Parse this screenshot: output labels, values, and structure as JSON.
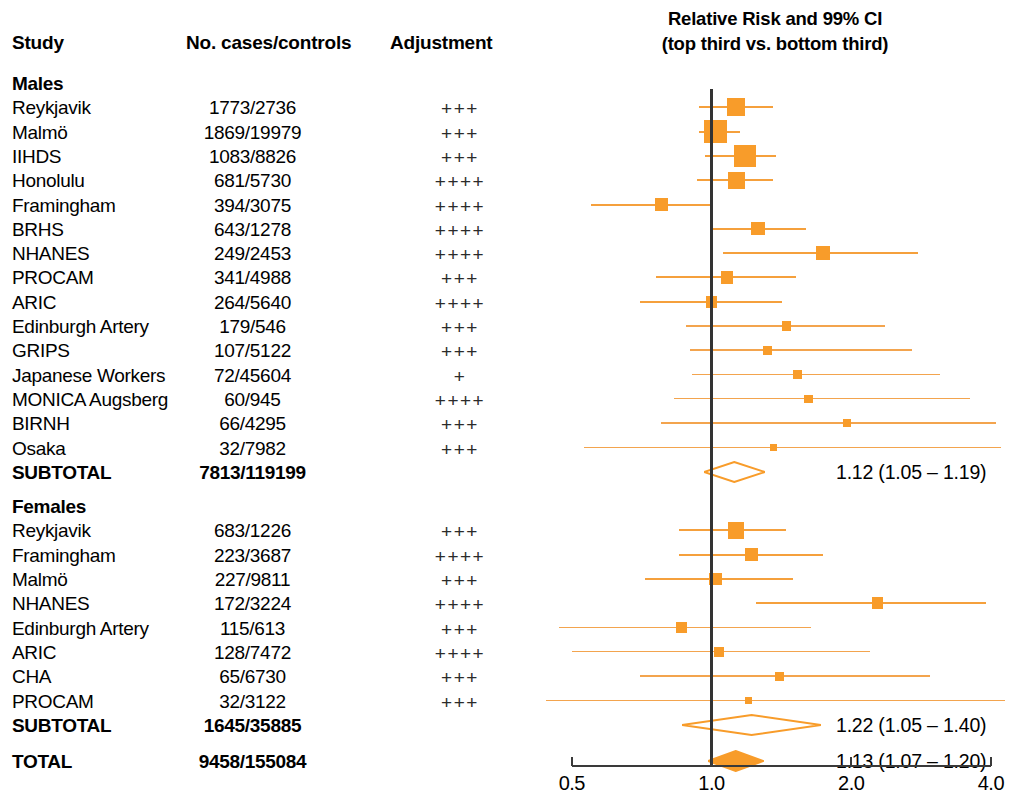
{
  "header": {
    "study": "Study",
    "cases": "No. cases/controls",
    "adjustment": "Adjustment",
    "plot_title_line1": "Relative Risk and 99% CI",
    "plot_title_line2": "(top third vs. bottom third)"
  },
  "axis": {
    "ticks": [
      "0.5",
      "1.0",
      "2.0",
      "4.0"
    ],
    "tick_values": [
      0.5,
      1.0,
      2.0,
      4.0
    ],
    "scale": "log",
    "reference_value": 1.0
  },
  "groups": [
    {
      "name": "Males"
    },
    {
      "name": "Females"
    }
  ],
  "summaries": {
    "males_subtotal_label": "SUBTOTAL",
    "males_subtotal_n": "7813/119199",
    "males_subtotal_text": "1.12 (1.05 – 1.19)",
    "females_subtotal_label": "SUBTOTAL",
    "females_subtotal_n": "1645/35885",
    "females_subtotal_text": "1.22 (1.05 – 1.40)",
    "total_label": "TOTAL",
    "total_n": "9458/155084",
    "total_text": "1.13 (1.07 – 1.20)"
  },
  "colors": {
    "marker": "#f89c2a",
    "ci": "#f5a03c",
    "reference_line": "#333333",
    "axis": "#3a3a3a",
    "text": "#000000"
  },
  "chart_data": {
    "type": "scatter",
    "title": "Relative Risk and 99% CI (top third vs. bottom third)",
    "xlabel": "Relative Risk",
    "ylabel": "",
    "xscale": "log",
    "xlim": [
      0.5,
      4.0
    ],
    "xticks": [
      0.5,
      1.0,
      2.0,
      4.0
    ],
    "xticklabels": [
      "0.5",
      "1.0",
      "2.0",
      "4.0"
    ],
    "reference_line": 1.0,
    "grid": false,
    "legend": "none",
    "columns": [
      "Study",
      "No. cases/controls",
      "Adjustment",
      "RR",
      "CI low",
      "CI high"
    ],
    "groups": [
      {
        "name": "Males",
        "rows": [
          {
            "study": "Reykjavik",
            "n": "1773/2736",
            "adjustment": "+++",
            "rr": 1.13,
            "lo": 0.94,
            "hi": 1.36,
            "weight": 9.0,
            "marker": "square"
          },
          {
            "study": "Malmö",
            "n": "1869/19979",
            "adjustment": "+++",
            "rr": 1.02,
            "lo": 0.94,
            "hi": 1.15,
            "weight": 12.5,
            "marker": "square"
          },
          {
            "study": "IIHDS",
            "n": "1083/8826",
            "adjustment": "+++",
            "rr": 1.18,
            "lo": 0.97,
            "hi": 1.38,
            "weight": 11.5,
            "marker": "square"
          },
          {
            "study": "Honolulu",
            "n": "681/5730",
            "adjustment": "++++",
            "rr": 1.13,
            "lo": 0.93,
            "hi": 1.36,
            "weight": 8.5,
            "marker": "square"
          },
          {
            "study": "Framingham",
            "n": "394/3075",
            "adjustment": "++++",
            "rr": 0.78,
            "lo": 0.55,
            "hi": 1.0,
            "weight": 6.0,
            "marker": "square"
          },
          {
            "study": "BRHS",
            "n": "643/1278",
            "adjustment": "++++",
            "rr": 1.26,
            "lo": 1.0,
            "hi": 1.6,
            "weight": 6.0,
            "marker": "square"
          },
          {
            "study": "NHANES",
            "n": "249/2453",
            "adjustment": "++++",
            "rr": 1.74,
            "lo": 1.06,
            "hi": 2.78,
            "weight": 6.5,
            "marker": "square"
          },
          {
            "study": "PROCAM",
            "n": "341/4988",
            "adjustment": "+++",
            "rr": 1.08,
            "lo": 0.76,
            "hi": 1.52,
            "weight": 5.5,
            "marker": "square"
          },
          {
            "study": "ARIC",
            "n": "264/5640",
            "adjustment": "++++",
            "rr": 1.0,
            "lo": 0.7,
            "hi": 1.42,
            "weight": 5.0,
            "marker": "square"
          },
          {
            "study": "Edinburgh Artery",
            "n": "179/546",
            "adjustment": "+++",
            "rr": 1.45,
            "lo": 0.88,
            "hi": 2.36,
            "weight": 3.5,
            "marker": "square"
          },
          {
            "study": "GRIPS",
            "n": "107/5122",
            "adjustment": "+++",
            "rr": 1.32,
            "lo": 0.9,
            "hi": 2.7,
            "weight": 3.2,
            "marker": "square"
          },
          {
            "study": "Japanese Workers",
            "n": "72/45604",
            "adjustment": "+",
            "rr": 1.53,
            "lo": 0.91,
            "hi": 3.1,
            "weight": 3.0,
            "marker": "square"
          },
          {
            "study": "MONICA Augsberg",
            "n": "60/945",
            "adjustment": "++++",
            "rr": 1.62,
            "lo": 0.83,
            "hi": 3.6,
            "weight": 3.0,
            "marker": "square"
          },
          {
            "study": "BIRNH",
            "n": "66/4295",
            "adjustment": "+++",
            "rr": 1.96,
            "lo": 0.78,
            "hi": 4.1,
            "weight": 2.5,
            "marker": "square"
          },
          {
            "study": "Osaka",
            "n": "32/7982",
            "adjustment": "+++",
            "rr": 1.36,
            "lo": 0.53,
            "hi": 4.2,
            "weight": 2.0,
            "marker": "square"
          }
        ],
        "subtotal": {
          "label": "SUBTOTAL",
          "n": "7813/119199",
          "rr": 1.12,
          "lo": 1.05,
          "hi": 1.19,
          "text": "1.12 (1.05 – 1.19)",
          "marker": "hollow-diamond"
        }
      },
      {
        "name": "Females",
        "rows": [
          {
            "study": "Reykjavik",
            "n": "683/1226",
            "adjustment": "+++",
            "rr": 1.13,
            "lo": 0.85,
            "hi": 1.45,
            "weight": 8.0,
            "marker": "square"
          },
          {
            "study": "Framingham",
            "n": "223/3687",
            "adjustment": "++++",
            "rr": 1.22,
            "lo": 0.85,
            "hi": 1.74,
            "weight": 6.0,
            "marker": "square"
          },
          {
            "study": "Malmö",
            "n": "227/9811",
            "adjustment": "+++",
            "rr": 1.02,
            "lo": 0.72,
            "hi": 1.5,
            "weight": 5.5,
            "marker": "square"
          },
          {
            "study": "NHANES",
            "n": "172/3224",
            "adjustment": "++++",
            "rr": 2.28,
            "lo": 1.25,
            "hi": 3.9,
            "weight": 5.0,
            "marker": "square"
          },
          {
            "study": "Edinburgh Artery",
            "n": "115/613",
            "adjustment": "+++",
            "rr": 0.86,
            "lo": 0.47,
            "hi": 1.64,
            "weight": 4.5,
            "marker": "square"
          },
          {
            "study": "ARIC",
            "n": "128/7472",
            "adjustment": "++++",
            "rr": 1.04,
            "lo": 0.5,
            "hi": 2.2,
            "weight": 4.0,
            "marker": "square"
          },
          {
            "study": "CHA",
            "n": "65/6730",
            "adjustment": "+++",
            "rr": 1.4,
            "lo": 0.7,
            "hi": 2.95,
            "weight": 3.2,
            "marker": "square"
          },
          {
            "study": "PROCAM",
            "n": "32/3122",
            "adjustment": "+++",
            "rr": 1.2,
            "lo": 0.44,
            "hi": 4.3,
            "weight": 2.2,
            "marker": "square"
          }
        ],
        "subtotal": {
          "label": "SUBTOTAL",
          "n": "1645/35885",
          "rr": 1.22,
          "lo": 1.05,
          "hi": 1.4,
          "text": "1.22 (1.05 – 1.40)",
          "marker": "hollow-diamond"
        }
      }
    ],
    "total": {
      "label": "TOTAL",
      "n": "9458/155084",
      "rr": 1.13,
      "lo": 1.07,
      "hi": 1.2,
      "text": "1.13 (1.07 – 1.20)",
      "marker": "solid-diamond"
    }
  }
}
